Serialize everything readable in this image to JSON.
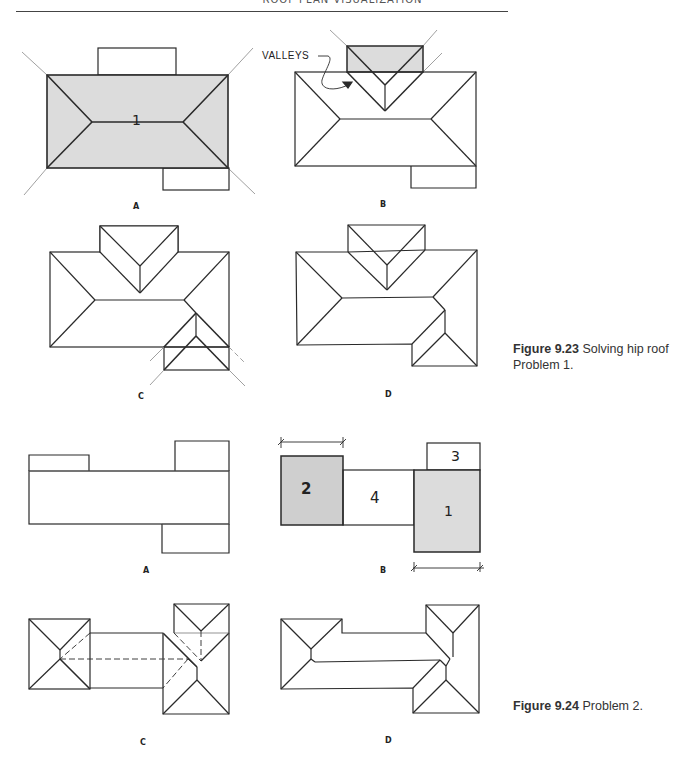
{
  "page": {
    "running_header": "ROOF PLAN VISUALIZATION"
  },
  "figure_9_23": {
    "caption_label": "Figure 9.23",
    "caption_text": "Solving hip roof Problem 1.",
    "panels": [
      {
        "label": "A",
        "area_number": "1"
      },
      {
        "label": "B",
        "annotation": "VALLEYS"
      },
      {
        "label": "C"
      },
      {
        "label": "D"
      }
    ]
  },
  "figure_9_24": {
    "caption_label": "Figure 9.24",
    "caption_text": "Problem 2.",
    "panels": [
      {
        "label": "A"
      },
      {
        "label": "B",
        "area_numbers": [
          "2",
          "4",
          "1",
          "3"
        ]
      },
      {
        "label": "C"
      },
      {
        "label": "D"
      }
    ]
  },
  "colors": {
    "line": "#2a2a2a",
    "shade_light": "#dcdcdc",
    "shade_dark": "#cfcfcf",
    "thin_line": "#888888"
  }
}
